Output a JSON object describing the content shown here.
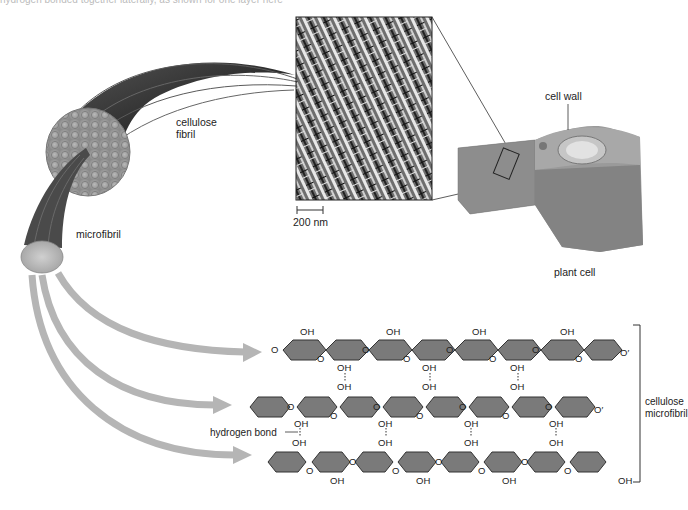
{
  "figure": {
    "top_caption_fragment": "hydrogen bonded together laterally, as shown for one layer here",
    "labels": {
      "cellulose_fibril": [
        "cellulose",
        "fibril"
      ],
      "microfibril": "microfibril",
      "scale_bar": "200 nm",
      "cell_wall": "cell wall",
      "plant_cell": "plant cell",
      "hydrogen_bond": "hydrogen bond",
      "cellulose_microfibril": [
        "cellulose",
        "microfibril"
      ]
    },
    "chem": {
      "oh": "OH",
      "o": "O",
      "o_end": "O′",
      "oh_end": "OH"
    },
    "colors": {
      "ring_fill": "#7a7a7a",
      "ring_stroke": "#333333",
      "arrow": "#b5b5b5",
      "fibril_dark": "#3a3a3a",
      "cell_gray": "#8c8c8c"
    }
  }
}
